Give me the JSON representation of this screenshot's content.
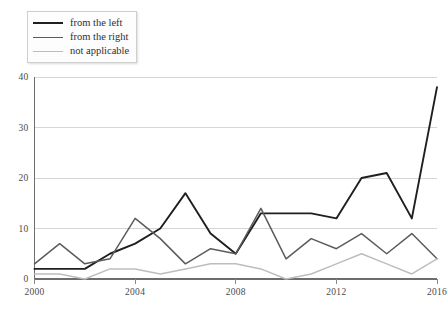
{
  "chart_data": {
    "type": "line",
    "title": "",
    "xlabel": "",
    "ylabel": "",
    "x": [
      2000,
      2001,
      2002,
      2003,
      2004,
      2005,
      2006,
      2007,
      2008,
      2009,
      2010,
      2011,
      2012,
      2013,
      2014,
      2015,
      2016
    ],
    "xlim": [
      2000,
      2016
    ],
    "ylim": [
      0,
      40
    ],
    "xticks": [
      2000,
      2004,
      2008,
      2012,
      2016
    ],
    "xtick_labels": [
      "2000",
      "2004",
      "2008",
      "2012",
      "2016"
    ],
    "yticks": [
      0,
      10,
      20,
      30,
      40
    ],
    "ytick_labels": [
      "0",
      "10",
      "20",
      "30",
      "40"
    ],
    "grid": true,
    "legend_position": "top-left",
    "series": [
      {
        "name": "from the left",
        "color": "#1f1f1f",
        "width": 1.9,
        "values": [
          2,
          2,
          2,
          5,
          7,
          10,
          17,
          9,
          5,
          13,
          13,
          13,
          12,
          20,
          21,
          12,
          38
        ]
      },
      {
        "name": "from the right",
        "color": "#5c5c5c",
        "width": 1.5,
        "values": [
          3,
          7,
          3,
          4,
          12,
          8,
          3,
          6,
          5,
          14,
          4,
          8,
          6,
          9,
          5,
          9,
          4
        ]
      },
      {
        "name": "not applicable",
        "color": "#bdbdbd",
        "width": 1.5,
        "values": [
          1,
          1,
          0,
          2,
          2,
          1,
          2,
          3,
          3,
          2,
          0,
          1,
          3,
          5,
          3,
          1,
          4
        ]
      }
    ]
  },
  "legend": {
    "items": [
      {
        "label": "from the left",
        "color": "#1f1f1f",
        "width": 2.4
      },
      {
        "label": "from the right",
        "color": "#5c5c5c",
        "width": 1.9
      },
      {
        "label": "not applicable",
        "color": "#bdbdbd",
        "width": 1.4
      }
    ]
  },
  "caption": {
    "text": ""
  }
}
